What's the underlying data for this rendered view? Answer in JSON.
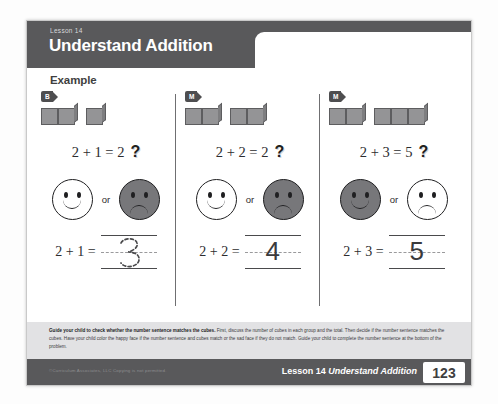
{
  "header": {
    "kicker": "Lesson 14",
    "title": "Understand Addition",
    "name_label": "Name"
  },
  "section_label": "Example",
  "columns": [
    {
      "badge": "B",
      "group_a_cubes": 2,
      "group_b_cubes": 1,
      "equation": "2 + 1 = 2",
      "question_mark": "?",
      "or_text": "or",
      "happy_selected": false,
      "sad_selected": true,
      "answer_prompt": "2 + 1 =",
      "written_answer": "3",
      "answer_style": "traced"
    },
    {
      "badge": "M",
      "group_a_cubes": 2,
      "group_b_cubes": 2,
      "equation": "2 + 2 = 2",
      "question_mark": "?",
      "or_text": "or",
      "happy_selected": false,
      "sad_selected": true,
      "answer_prompt": "2 + 2 =",
      "written_answer": "4",
      "answer_style": "handwritten"
    },
    {
      "badge": "M",
      "group_a_cubes": 2,
      "group_b_cubes": 3,
      "equation": "2 + 3 = 5",
      "question_mark": "?",
      "or_text": "or",
      "happy_selected": true,
      "sad_selected": false,
      "answer_prompt": "2 + 3 =",
      "written_answer": "5",
      "answer_style": "handwritten"
    }
  ],
  "note": {
    "bold_lead": "Guide your child to check whether the number sentence matches the cubes.",
    "body": " First, discuss the number of cubes in each group and the total. Then decide if the number sentence matches the cubes. Have your child color the happy face if the number sentence and cubes match or the sad face if they do not match. Guide your child to complete the number sentence at the bottom of the problem."
  },
  "footer": {
    "copyright": "©Curriculum Associates, LLC   Copying is not permitted.",
    "lesson_prefix": "Lesson 14 ",
    "lesson_title": "Understand Addition",
    "page_number": "123"
  },
  "colors": {
    "header_bar": "#59595b",
    "note_bar": "#e2e2e4",
    "cube_face": "#949496",
    "face_fill": "#77777a"
  }
}
